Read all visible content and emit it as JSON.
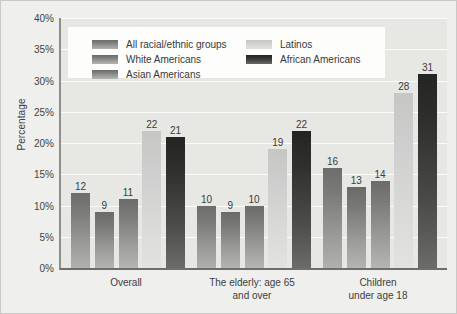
{
  "chart_data": {
    "type": "bar",
    "title": "",
    "xlabel": "",
    "ylabel": "Percentage",
    "ylim": [
      0,
      40
    ],
    "ytick_labels": [
      "40%",
      "35%",
      "30%",
      "25%",
      "20%",
      "15%",
      "10%",
      "5%",
      "0%"
    ],
    "ytick_values": [
      40,
      35,
      30,
      25,
      20,
      15,
      10,
      5,
      0
    ],
    "grid": true,
    "legend_position": "top-center-inside",
    "categories": [
      "Overall",
      "The elderly: age 65 and over",
      "Children under age 18"
    ],
    "category_lines": [
      [
        "Overall"
      ],
      [
        "The elderly: age 65",
        "and over"
      ],
      [
        "Children",
        "under age 18"
      ]
    ],
    "series": [
      {
        "name": "All racial/ethnic groups",
        "color": "#7f7f7d",
        "values": [
          12,
          10,
          16
        ]
      },
      {
        "name": "White Americans",
        "color": "#828280",
        "values": [
          9,
          9,
          13
        ]
      },
      {
        "name": "Asian Americans",
        "color": "#838381",
        "values": [
          11,
          10,
          14
        ]
      },
      {
        "name": "Latinos",
        "color": "#d4d4d2",
        "values": [
          22,
          19,
          28
        ]
      },
      {
        "name": "African Americans",
        "color": "#2e2e2d",
        "values": [
          21,
          22,
          31
        ]
      }
    ]
  },
  "legend": {
    "left_column": [
      {
        "label": "All racial/ethnic groups",
        "swatch": "fill-all"
      },
      {
        "label": "White Americans",
        "swatch": "fill-white"
      },
      {
        "label": "Asian Americans",
        "swatch": "fill-asian"
      }
    ],
    "right_column": [
      {
        "label": "Latinos",
        "swatch": "fill-latino"
      },
      {
        "label": "African Americans",
        "swatch": "fill-african"
      }
    ]
  },
  "colors": {
    "page_background": "#efefed",
    "plot_background": "#e7e7e4",
    "gridline": "#fbfbfa",
    "axis": "#8e8e8a",
    "legend_background": "#fdfdfc",
    "text": "#3a3a3a"
  }
}
